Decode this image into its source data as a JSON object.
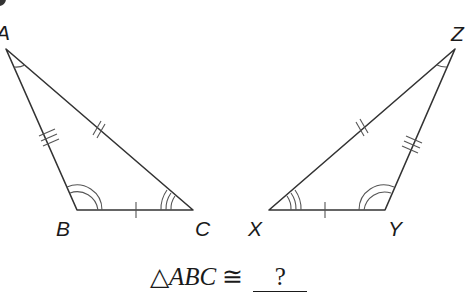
{
  "diagram": {
    "stroke_color": "#333333",
    "mark_color": "#555555",
    "triangle_left": {
      "name": "ABC",
      "vertices": {
        "A": {
          "label": "A",
          "x": 6,
          "y": 49
        },
        "B": {
          "label": "B",
          "x": 77,
          "y": 210
        },
        "C": {
          "label": "C",
          "x": 193,
          "y": 210
        }
      },
      "side_marks": {
        "AB": 3,
        "AC": 2,
        "BC": 1
      },
      "angle_marks": {
        "A": 1,
        "B": 2,
        "C": 3
      }
    },
    "triangle_right": {
      "name": "XYZ",
      "vertices": {
        "X": {
          "label": "X",
          "x": 269,
          "y": 210
        },
        "Y": {
          "label": "Y",
          "x": 385,
          "y": 210
        },
        "Z": {
          "label": "Z",
          "x": 455,
          "y": 49
        }
      },
      "side_marks": {
        "YZ": 3,
        "XZ": 2,
        "XY": 1
      },
      "angle_marks": {
        "Z": 1,
        "Y": 2,
        "X": 3
      }
    }
  },
  "statement": {
    "triangle_symbol": "△",
    "triangle_name": "ABC",
    "congruent_symbol": "≅",
    "answer_placeholder": "?"
  }
}
